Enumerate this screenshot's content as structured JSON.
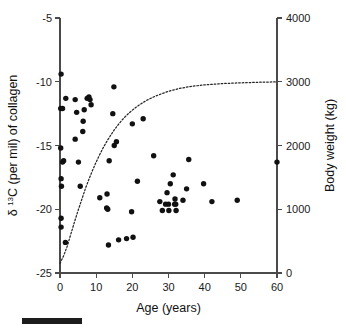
{
  "chart_data": {
    "type": "scatter",
    "title": "",
    "xlabel": "Age (years)",
    "ylabel": "δ 13C (per mil) of collagen",
    "ylabel_delta": "δ",
    "ylabel_superscript": "13",
    "ylabel_rest": "C (per mil) of collagen",
    "y2label": "Body weight (kg)",
    "xlim": [
      0,
      60
    ],
    "ylim": [
      -25,
      -5
    ],
    "y2lim": [
      0,
      4000
    ],
    "xticks": [
      0,
      10,
      20,
      30,
      40,
      50,
      60
    ],
    "xticklabels": [
      "0",
      "10",
      "20",
      "30",
      "40",
      "50",
      "60"
    ],
    "yticks": [
      -5,
      -10,
      -15,
      -20,
      -25
    ],
    "yticklabels": [
      "-5",
      "-10",
      "-15",
      "-20",
      "-25"
    ],
    "y2ticks": [
      0,
      1000,
      2000,
      3000,
      4000
    ],
    "y2ticklabels": [
      "0",
      "1000",
      "2000",
      "3000",
      "4000"
    ],
    "grid": false,
    "legend": false,
    "series": [
      {
        "name": "delta 13C of collagen vs age",
        "marker": "filled-circle",
        "color": "#111111",
        "points": [
          [
            0.3,
            -9.4
          ],
          [
            0.2,
            -12.1
          ],
          [
            0.7,
            -12.1
          ],
          [
            1.6,
            -11.3
          ],
          [
            0.2,
            -15.2
          ],
          [
            0.7,
            -16.3
          ],
          [
            1.0,
            -16.2
          ],
          [
            0.3,
            -17.6
          ],
          [
            0.4,
            -18.2
          ],
          [
            0.3,
            -20.7
          ],
          [
            0.3,
            -21.4
          ],
          [
            1.5,
            -22.6
          ],
          [
            4.2,
            -11.4
          ],
          [
            4.6,
            -12.4
          ],
          [
            4.2,
            -14.5
          ],
          [
            5.1,
            -16.3
          ],
          [
            5.6,
            -18.2
          ],
          [
            6.7,
            -12.2
          ],
          [
            6.4,
            -13.1
          ],
          [
            6.3,
            -13.9
          ],
          [
            7.5,
            -11.3
          ],
          [
            8.0,
            -11.2
          ],
          [
            8.3,
            -11.4
          ],
          [
            8.6,
            -11.8
          ],
          [
            11.0,
            -19.1
          ],
          [
            12.9,
            -19.9
          ],
          [
            13.2,
            -20.0
          ],
          [
            13.6,
            -16.2
          ],
          [
            13.0,
            -18.8
          ],
          [
            13.4,
            -22.8
          ],
          [
            14.9,
            -10.4
          ],
          [
            14.6,
            -12.5
          ],
          [
            15.0,
            -15.0
          ],
          [
            15.6,
            -14.7
          ],
          [
            16.2,
            -22.4
          ],
          [
            18.4,
            -22.3
          ],
          [
            20.0,
            -13.3
          ],
          [
            19.8,
            -20.2
          ],
          [
            20.2,
            -22.2
          ],
          [
            21.4,
            -17.8
          ],
          [
            23.0,
            -12.9
          ],
          [
            25.9,
            -15.8
          ],
          [
            27.6,
            -19.4
          ],
          [
            28.3,
            -20.1
          ],
          [
            29.6,
            -18.7
          ],
          [
            29.2,
            -19.6
          ],
          [
            30.0,
            -19.6
          ],
          [
            30.1,
            -20.1
          ],
          [
            30.5,
            -18.0
          ],
          [
            31.3,
            -17.3
          ],
          [
            31.7,
            -19.6
          ],
          [
            31.8,
            -19.2
          ],
          [
            32.0,
            -19.6
          ],
          [
            32.1,
            -20.1
          ],
          [
            34.0,
            -19.3
          ],
          [
            35.0,
            -18.4
          ],
          [
            35.6,
            -16.1
          ],
          [
            39.7,
            -18.0
          ],
          [
            42.0,
            -19.4
          ],
          [
            49.0,
            -19.3
          ],
          [
            60.0,
            -16.3
          ]
        ]
      }
    ],
    "curve": {
      "name": "Body weight growth curve",
      "style": "dotted",
      "color": "#262626",
      "asymptote_kg": 3000,
      "points": [
        [
          0.0,
          150
        ],
        [
          1.0,
          270
        ],
        [
          2.0,
          420
        ],
        [
          3.0,
          610
        ],
        [
          4.0,
          800
        ],
        [
          5.0,
          980
        ],
        [
          6.0,
          1150
        ],
        [
          7.0,
          1320
        ],
        [
          8.0,
          1470
        ],
        [
          9.0,
          1610
        ],
        [
          10.0,
          1740
        ],
        [
          11.0,
          1860
        ],
        [
          12.0,
          1970
        ],
        [
          13.0,
          2070
        ],
        [
          14.0,
          2160
        ],
        [
          15.0,
          2245
        ],
        [
          16.0,
          2320
        ],
        [
          17.0,
          2390
        ],
        [
          18.0,
          2450
        ],
        [
          19.0,
          2505
        ],
        [
          20.0,
          2555
        ],
        [
          22.0,
          2640
        ],
        [
          24.0,
          2710
        ],
        [
          26.0,
          2765
        ],
        [
          28.0,
          2810
        ],
        [
          30.0,
          2850
        ],
        [
          33.0,
          2895
        ],
        [
          36.0,
          2925
        ],
        [
          40.0,
          2952
        ],
        [
          45.0,
          2972
        ],
        [
          50.0,
          2983
        ],
        [
          55.0,
          2992
        ],
        [
          60.0,
          2998
        ]
      ]
    }
  },
  "annotations": {
    "scale_bar_label": ""
  }
}
